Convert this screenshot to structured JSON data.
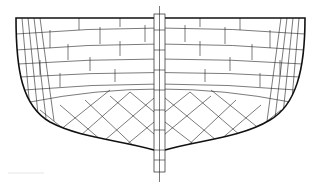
{
  "figure": {
    "colors": {
      "line": "#111111",
      "background": "#ffffff"
    },
    "hull": {
      "top_y": 18,
      "left_x": 16,
      "right_x": 305,
      "bottom_y": 150
    },
    "keel": {
      "x": 154,
      "width": 11,
      "top_y": 8,
      "bottom_y": 180
    },
    "plank_rows_upper": 6,
    "diagonal_planking_lower": true
  }
}
